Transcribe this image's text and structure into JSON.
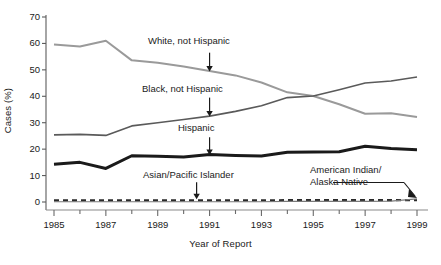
{
  "chart_data": {
    "type": "line",
    "title": "",
    "xlabel": "Year of Report",
    "ylabel": "Cases (%)",
    "xlim": [
      1985,
      1999
    ],
    "ylim": [
      0,
      70
    ],
    "grid": false,
    "legend_position": "inline-annotations",
    "x": [
      1985,
      1986,
      1987,
      1988,
      1989,
      1990,
      1991,
      1992,
      1993,
      1994,
      1995,
      1996,
      1997,
      1998,
      1999
    ],
    "x_tick_labels": [
      "1985",
      "1987",
      "1989",
      "1991",
      "1993",
      "1995",
      "1997",
      "1999"
    ],
    "x_tick_values": [
      1985,
      1987,
      1989,
      1991,
      1993,
      1995,
      1997,
      1999
    ],
    "x_minor_tick_values": [
      1986,
      1988,
      1990,
      1992,
      1994,
      1996,
      1998
    ],
    "y_tick_labels": [
      "0",
      "10",
      "20",
      "30",
      "40",
      "50",
      "60",
      "70"
    ],
    "y_tick_values": [
      0,
      10,
      20,
      30,
      40,
      50,
      60,
      70
    ],
    "series": [
      {
        "name": "White, not Hispanic",
        "color": "#9a9a9a",
        "width": 2.0,
        "style": "solid",
        "values": [
          59.6,
          58.8,
          61.0,
          53.6,
          52.7,
          51.3,
          49.6,
          47.9,
          45.2,
          41.5,
          40.1,
          37.0,
          33.4,
          33.6,
          32.2
        ]
      },
      {
        "name": "Black, not Hispanic",
        "color": "#5a5a5a",
        "width": 1.6,
        "style": "solid",
        "values": [
          25.4,
          25.6,
          25.2,
          28.8,
          30.0,
          31.2,
          32.5,
          34.3,
          36.4,
          39.5,
          40.1,
          42.5,
          45.0,
          45.8,
          47.3
        ]
      },
      {
        "name": "Hispanic",
        "color": "#1a1a1a",
        "width": 3.0,
        "style": "solid",
        "values": [
          14.3,
          15.0,
          12.7,
          17.5,
          17.3,
          17.0,
          18.0,
          17.6,
          17.4,
          18.8,
          18.9,
          19.0,
          21.1,
          20.2,
          19.8
        ]
      },
      {
        "name": "Asian/Pacific Islander",
        "color": "#2a2a2a",
        "width": 2.2,
        "style": "dashed",
        "values": [
          0.6,
          0.6,
          0.6,
          0.6,
          0.6,
          0.6,
          0.6,
          0.6,
          0.6,
          0.7,
          0.7,
          0.7,
          0.7,
          0.7,
          0.7
        ]
      },
      {
        "name": "American Indian/Alaska Native",
        "color": "#7a7a7a",
        "width": 1.2,
        "style": "solid",
        "values": [
          0.1,
          0.1,
          0.1,
          0.1,
          0.1,
          0.1,
          0.1,
          0.1,
          0.1,
          0.2,
          0.2,
          0.2,
          0.2,
          0.3,
          1.2
        ]
      }
    ],
    "annotations": [
      {
        "text": "White, not Hispanic",
        "target_year": 1991,
        "target_value": 49.6
      },
      {
        "text": "Black, not Hispanic",
        "target_year": 1991,
        "target_value": 32.5
      },
      {
        "text": "Hispanic",
        "target_year": 1991,
        "target_value": 18.0
      },
      {
        "text": "Asian/Pacific Islander",
        "target_year": 1990.5,
        "target_value": 0.6
      },
      {
        "text": "American Indian/",
        "target_year": 1999,
        "target_value": 1.2
      },
      {
        "text": "Alaska Native",
        "target_year": 1999,
        "target_value": 1.2
      }
    ]
  },
  "annotation_labels": {
    "white": "White, not Hispanic",
    "black": "Black, not Hispanic",
    "hispanic": "Hispanic",
    "asian": "Asian/Pacific Islander",
    "amind_line1": "American Indian/",
    "amind_line2": "Alaska Native"
  },
  "axis": {
    "y_title": "Cases (%)",
    "x_title": "Year of Report"
  }
}
